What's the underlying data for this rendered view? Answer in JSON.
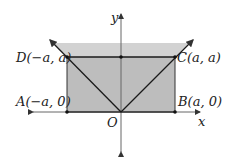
{
  "diagram": {
    "axes": {
      "x_label": "x",
      "y_label": "y",
      "origin_label": "O"
    },
    "points": {
      "A": "A(−a, 0)",
      "B": "B(a, 0)",
      "C": "C(a, a)",
      "D": "D(−a, a)"
    },
    "colors": {
      "rect_fill": "#bdbdbd",
      "top_fill": "#cfcfcf",
      "line": "#1a1a1a",
      "axis": "#555555"
    }
  }
}
